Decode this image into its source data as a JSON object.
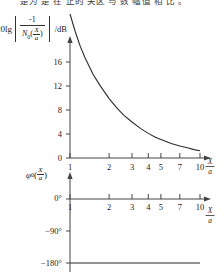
{
  "caption": {
    "text": "是为 是 在 正的 关区 与 数 幅值 相 比 。"
  },
  "magnitude_axis": {
    "label_prefix": "20lg",
    "numerator": "-1",
    "denominator_symbol": "N",
    "denominator_subscript": "0",
    "denominator_arg_top": "X",
    "denominator_arg_bottom": "a",
    "unit": "/dB",
    "ticks": [
      "0",
      "4",
      "8",
      "12",
      "16"
    ]
  },
  "phase_axis": {
    "symbol": "φ",
    "subscript": "0",
    "arg_top": "X",
    "arg_bottom": "a",
    "ticks": [
      "0°",
      "−90°",
      "−180°"
    ]
  },
  "x_axis": {
    "label_top": "X",
    "label_bottom": "a",
    "ticks": [
      "1",
      "2",
      "3",
      "4",
      "5",
      "7",
      "10"
    ]
  },
  "colors": {
    "curve": "#2b2b2b",
    "axis": "#444444",
    "background": "#ffffff"
  },
  "chart_data": [
    {
      "type": "line",
      "title": "20lg|-1/N0(X/a)| /dB",
      "xlabel": "X/a",
      "ylabel": "20lg|-1/N0(X/a)| /dB",
      "xscale": "log",
      "xlim": [
        1,
        10
      ],
      "ylim": [
        0,
        20
      ],
      "grid": false,
      "legend": "none",
      "xticks": [
        1,
        2,
        3,
        4,
        5,
        7,
        10
      ],
      "yticks": [
        0,
        4,
        8,
        12,
        16
      ],
      "x": [
        1.0,
        1.1,
        1.2,
        1.3,
        1.5,
        1.7,
        2.0,
        2.3,
        2.6,
        3.0,
        3.5,
        4.0,
        4.5,
        5.0,
        6.0,
        7.0,
        8.0,
        9.0,
        10.0
      ],
      "y": [
        24.0,
        21.0,
        18.6,
        16.8,
        14.0,
        12.1,
        9.9,
        8.3,
        7.1,
        6.0,
        4.9,
        4.1,
        3.5,
        3.1,
        2.4,
        2.0,
        1.7,
        1.4,
        1.2
      ]
    },
    {
      "type": "line",
      "title": "φ0(X/a)",
      "xlabel": "X/a",
      "ylabel": "φ0(X/a)",
      "xscale": "log",
      "xlim": [
        1,
        10
      ],
      "ylim": [
        -200,
        10
      ],
      "grid": false,
      "legend": "none",
      "xticks": [
        1,
        2,
        3,
        4,
        5,
        7,
        10
      ],
      "yticks": [
        0,
        -90,
        -180
      ],
      "x": [
        1,
        10
      ],
      "y": [
        -180,
        -180
      ]
    }
  ]
}
